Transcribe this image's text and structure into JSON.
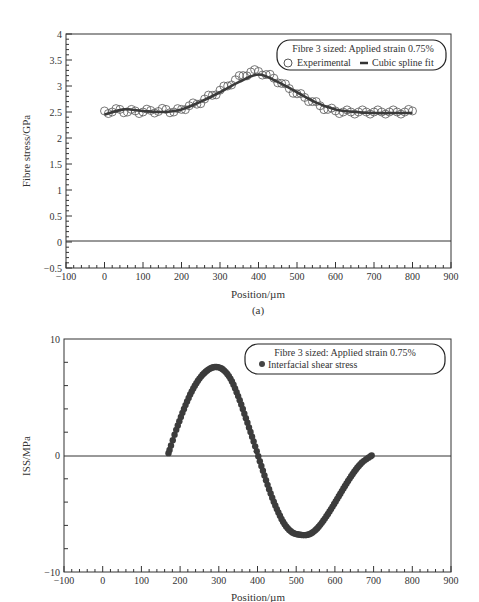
{
  "chart_data": [
    {
      "type": "scatter",
      "panel_label": "(a)",
      "title": "",
      "xlabel": "Position/µm",
      "ylabel": "Fibre stress/GPa",
      "xlim": [
        -100,
        900
      ],
      "ylim": [
        -0.5,
        4
      ],
      "x_ticks": [
        -100,
        0,
        100,
        200,
        300,
        400,
        500,
        600,
        700,
        800,
        900
      ],
      "y_ticks": [
        -0.5,
        0,
        0.5,
        1,
        1.5,
        2,
        2.5,
        3,
        3.5,
        4
      ],
      "y_tick_labels": [
        "−0.5",
        "0",
        "0.5",
        "1",
        "1.5",
        "2",
        "2.5",
        "3",
        "3.5",
        "4"
      ],
      "x_tick_labels": [
        "−100",
        "0",
        "100",
        "200",
        "300",
        "400",
        "500",
        "600",
        "700",
        "800",
        "900"
      ],
      "grid": false,
      "zero_line": true,
      "legend": {
        "position": "upper right",
        "title": "Fibre 3 sized: Applied strain 0.75%",
        "entries": [
          {
            "marker": "open-circle",
            "label": "Experimental"
          },
          {
            "marker": "thick-line",
            "label": "Cubic spline fit"
          }
        ]
      },
      "series": [
        {
          "name": "Experimental",
          "style": "open-circle",
          "x": [
            0,
            20,
            40,
            60,
            80,
            100,
            120,
            140,
            160,
            180,
            200,
            220,
            240,
            260,
            280,
            300,
            320,
            340,
            360,
            380,
            400,
            420,
            440,
            460,
            480,
            500,
            520,
            540,
            560,
            580,
            600,
            620,
            640,
            660,
            680,
            700,
            720,
            740,
            760,
            780,
            800
          ],
          "y": [
            2.52,
            2.5,
            2.55,
            2.5,
            2.52,
            2.5,
            2.53,
            2.51,
            2.55,
            2.5,
            2.55,
            2.62,
            2.65,
            2.75,
            2.82,
            2.92,
            3.0,
            3.12,
            3.2,
            3.27,
            3.28,
            3.22,
            3.15,
            3.05,
            2.95,
            2.85,
            2.78,
            2.7,
            2.62,
            2.55,
            2.52,
            2.5,
            2.5,
            2.5,
            2.5,
            2.5,
            2.5,
            2.5,
            2.5,
            2.5,
            2.52
          ]
        },
        {
          "name": "Cubic spline fit",
          "style": "thick-line",
          "x": [
            0,
            50,
            100,
            150,
            200,
            250,
            300,
            350,
            400,
            450,
            500,
            550,
            600,
            650,
            700,
            750,
            800
          ],
          "y": [
            2.45,
            2.55,
            2.52,
            2.5,
            2.55,
            2.7,
            2.88,
            3.08,
            3.22,
            3.08,
            2.88,
            2.68,
            2.55,
            2.5,
            2.48,
            2.48,
            2.48
          ]
        }
      ]
    },
    {
      "type": "scatter",
      "panel_label": "",
      "title": "",
      "xlabel": "Position/µm",
      "ylabel": "ISS/MPa",
      "xlim": [
        -100,
        900
      ],
      "ylim": [
        -10,
        10
      ],
      "x_ticks": [
        -100,
        0,
        100,
        200,
        300,
        400,
        500,
        600,
        700,
        800,
        900
      ],
      "x_tick_labels": [
        "−100",
        "0",
        "100",
        "200",
        "300",
        "400",
        "500",
        "600",
        "700",
        "800",
        "900"
      ],
      "y_ticks": [
        -10,
        0,
        10
      ],
      "y_tick_labels": [
        "−10",
        "0",
        "10"
      ],
      "y_minor_ticks": [
        -8,
        -6,
        -4,
        -2,
        2,
        4,
        6,
        8
      ],
      "grid": false,
      "zero_line": true,
      "legend": {
        "position": "upper right",
        "title": "Fibre 3 sized: Applied strain 0.75%",
        "entries": [
          {
            "marker": "filled-circle",
            "label": "Interfacial shear stress"
          }
        ]
      },
      "series": [
        {
          "name": "Interfacial shear stress",
          "style": "filled-circle",
          "x": [
            170,
            190,
            210,
            230,
            250,
            270,
            290,
            310,
            330,
            350,
            370,
            390,
            410,
            430,
            450,
            470,
            490,
            510,
            530,
            550,
            570,
            590,
            610,
            630,
            650,
            670,
            695
          ],
          "y": [
            0.2,
            2.2,
            4.0,
            5.5,
            6.6,
            7.3,
            7.6,
            7.4,
            6.6,
            5.1,
            3.2,
            1.2,
            -0.9,
            -2.9,
            -4.6,
            -5.9,
            -6.6,
            -6.8,
            -6.8,
            -6.4,
            -5.6,
            -4.6,
            -3.5,
            -2.4,
            -1.4,
            -0.6,
            0.0
          ]
        }
      ]
    }
  ]
}
